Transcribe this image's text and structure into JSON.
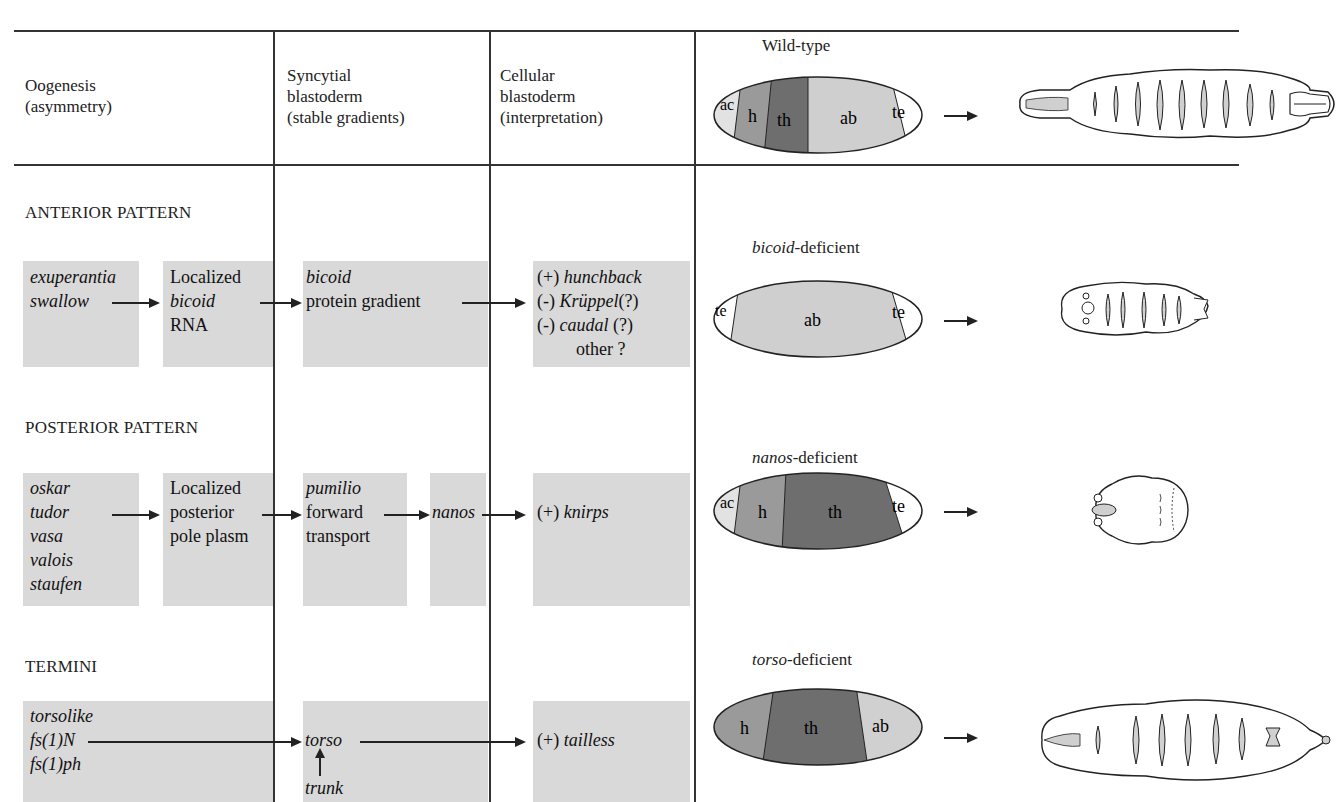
{
  "header": {
    "col1": [
      "Oogenesis",
      "(asymmetry)"
    ],
    "col2": [
      "Syncytial",
      "blastoderm",
      "(stable gradients)"
    ],
    "col3": [
      "Cellular",
      "blastoderm",
      "(interpretation)"
    ],
    "wildtype_label": "Wild-type"
  },
  "anterior": {
    "title": "ANTERIOR PATTERN",
    "oogenesis_genes": [
      "exuperantia",
      "swallow"
    ],
    "localized": [
      "Localized",
      "bicoid",
      "RNA"
    ],
    "syncytial": [
      "bicoid",
      "protein gradient"
    ],
    "cellular": [
      {
        "sign": "(+)",
        "gene": "hunchback",
        "note": ""
      },
      {
        "sign": "(-)",
        "gene": "Krüppel",
        "note": "(?)"
      },
      {
        "sign": "(-)",
        "gene": "caudal",
        "note": "(?)"
      },
      {
        "sign": "",
        "gene": "",
        "note": "other ?"
      }
    ],
    "mutant_gene": "bicoid",
    "mutant_suffix": "-deficient",
    "embryo_regions": [
      "te",
      "ab",
      "te"
    ]
  },
  "posterior": {
    "title": "POSTERIOR PATTERN",
    "oogenesis_genes": [
      "oskar",
      "tudor",
      "vasa",
      "valois",
      "staufen"
    ],
    "localized": [
      "Localized",
      "posterior",
      "pole plasm"
    ],
    "syncytial": [
      "pumilio",
      "forward",
      "transport"
    ],
    "nanos": "nanos",
    "cellular_sign": "(+)",
    "cellular_gene": "knirps",
    "mutant_gene": "nanos",
    "mutant_suffix": "-deficient",
    "embryo_regions": [
      "ac",
      "h",
      "th",
      "te"
    ]
  },
  "termini": {
    "title": "TERMINI",
    "oogenesis_genes": [
      "torsolike",
      "fs(1)N",
      "fs(1)ph"
    ],
    "syncytial_gene": "torso",
    "syncytial_input": "trunk",
    "cellular_sign": "(+)",
    "cellular_gene": "tailless",
    "mutant_gene": "torso",
    "mutant_suffix": "-deficient",
    "embryo_regions": [
      "h",
      "th",
      "ab"
    ]
  },
  "wildtype": {
    "embryo_regions": [
      "ac",
      "h",
      "th",
      "ab",
      "te"
    ]
  },
  "colors": {
    "box_fill": "#d9d9d9",
    "ac": "#e2e2e2",
    "h": "#9a9a9a",
    "th": "#6e6e6e",
    "ab": "#cfcfcf",
    "te": "#ffffff"
  }
}
